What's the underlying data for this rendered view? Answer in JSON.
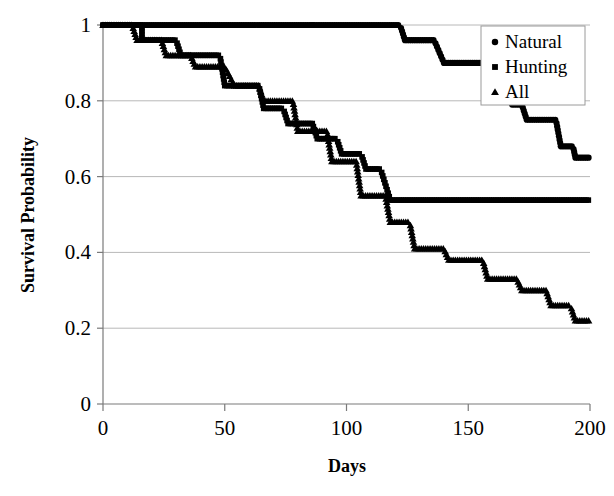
{
  "chart_data": {
    "type": "line",
    "title": "",
    "xlabel": "Days",
    "ylabel": "Survival Probability",
    "xlim": [
      0,
      200
    ],
    "ylim": [
      0,
      1
    ],
    "xticks": [
      0,
      50,
      100,
      150,
      200
    ],
    "xtick_labels": [
      "0",
      "50",
      "100",
      "150",
      "200"
    ],
    "yticks": [
      0,
      0.2,
      0.4,
      0.6,
      0.8,
      1
    ],
    "ytick_labels": [
      "0",
      "0.2",
      "0.4",
      "0.6",
      "0.8",
      "1"
    ],
    "grid": true,
    "grid_axis": "y",
    "legend_position": "top-right",
    "marker_style": "step-markers",
    "series": [
      {
        "name": "Natural",
        "marker": "circle",
        "x": [
          0,
          10,
          20,
          28,
          40,
          52,
          62,
          70,
          78,
          88,
          96,
          104,
          112,
          118,
          124,
          130,
          136,
          142,
          150,
          158,
          164,
          170,
          176,
          182,
          188,
          194,
          200
        ],
        "y": [
          1,
          1,
          1,
          1,
          1,
          1,
          1,
          1,
          1,
          1,
          1,
          1,
          1,
          1,
          0.96,
          0.96,
          0.9,
          0.9,
          0.87,
          0.83,
          0.79,
          0.75,
          0.72,
          0.68,
          0.65,
          0.65,
          0.65
        ]
      },
      {
        "name": "Hunting",
        "marker": "square",
        "x": [
          0,
          8,
          16,
          22,
          26,
          30,
          34,
          38,
          44,
          50,
          56,
          60,
          64,
          68,
          72,
          76,
          80,
          84,
          88,
          92,
          96,
          100,
          104,
          108,
          112,
          116,
          120,
          130,
          140,
          150,
          160,
          170,
          180,
          186,
          192,
          200
        ],
        "y": [
          1,
          1,
          1,
          0.96,
          0.96,
          0.92,
          0.92,
          0.92,
          0.92,
          0.92,
          0.84,
          0.84,
          0.84,
          0.81,
          0.78,
          0.76,
          0.74,
          0.74,
          0.7,
          0.7,
          0.66,
          0.66,
          0.66,
          0.62,
          0.58,
          0.538,
          0.538,
          0.538,
          0.538,
          0.538,
          0.538,
          0.538,
          0.538,
          0.538,
          0.538,
          0.538
        ]
      },
      {
        "name": "All",
        "marker": "triangle",
        "x": [
          0,
          10,
          18,
          24,
          30,
          36,
          42,
          48,
          54,
          58,
          62,
          66,
          70,
          74,
          78,
          82,
          86,
          90,
          94,
          98,
          102,
          106,
          110,
          114,
          118,
          122,
          126,
          132,
          138,
          144,
          150,
          156,
          162,
          168,
          174,
          180,
          186,
          192,
          198,
          200
        ],
        "y": [
          1,
          1,
          1,
          0.96,
          0.92,
          0.9,
          0.89,
          0.89,
          0.84,
          0.82,
          0.8,
          0.78,
          0.76,
          0.74,
          0.72,
          0.7,
          0.68,
          0.66,
          0.64,
          0.61,
          0.6,
          0.58,
          0.55,
          0.52,
          0.5,
          0.48,
          0.44,
          0.41,
          0.41,
          0.41,
          0.38,
          0.35,
          0.33,
          0.31,
          0.31,
          0.28,
          0.26,
          0.24,
          0.22,
          0.22
        ]
      }
    ],
    "step_segments": {
      "Natural": [
        [
          0,
          86,
          1.0
        ],
        [
          86,
          122,
          1.0
        ],
        [
          124,
          136,
          0.96
        ],
        [
          140,
          158,
          0.9
        ],
        [
          160,
          166,
          0.83
        ],
        [
          168,
          172,
          0.79
        ],
        [
          174,
          186,
          0.75
        ],
        [
          188,
          193,
          0.68
        ],
        [
          194,
          200,
          0.65
        ]
      ],
      "Hunting": [
        [
          0,
          16,
          1.0
        ],
        [
          16,
          30,
          0.96
        ],
        [
          32,
          48,
          0.92
        ],
        [
          50,
          64,
          0.84
        ],
        [
          66,
          74,
          0.78
        ],
        [
          76,
          86,
          0.74
        ],
        [
          88,
          96,
          0.7
        ],
        [
          98,
          106,
          0.66
        ],
        [
          108,
          114,
          0.62
        ],
        [
          118,
          200,
          0.538
        ]
      ],
      "All": [
        [
          0,
          12,
          1.0
        ],
        [
          14,
          24,
          0.96
        ],
        [
          26,
          36,
          0.92
        ],
        [
          38,
          50,
          0.89
        ],
        [
          54,
          64,
          0.84
        ],
        [
          66,
          78,
          0.8
        ],
        [
          80,
          92,
          0.72
        ],
        [
          94,
          104,
          0.64
        ],
        [
          106,
          116,
          0.55
        ],
        [
          118,
          126,
          0.48
        ],
        [
          128,
          140,
          0.41
        ],
        [
          142,
          156,
          0.38
        ],
        [
          158,
          170,
          0.33
        ],
        [
          172,
          182,
          0.3
        ],
        [
          184,
          192,
          0.26
        ],
        [
          194,
          200,
          0.22
        ]
      ]
    }
  },
  "legend": {
    "items": [
      {
        "label": "Natural",
        "marker": "circle-marker"
      },
      {
        "label": "Hunting",
        "marker": "square-marker"
      },
      {
        "label": "All",
        "marker": "triangle-marker"
      }
    ]
  },
  "axes": {
    "y_title": "Survival Probability",
    "x_title": "Days"
  },
  "colors": {
    "series": "#000000",
    "grid": "#b8b8b8",
    "axis": "#7a7a7a",
    "background": "#ffffff"
  }
}
